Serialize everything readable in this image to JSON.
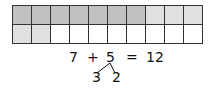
{
  "grid": {
    "rows": 2,
    "cols": 10,
    "colors": {
      "dark": "#c0c0c0",
      "light": "#e0e0e0",
      "empty": "#ffffff",
      "border": "#333333"
    },
    "cells": [
      [
        "dark",
        "dark",
        "dark",
        "dark",
        "dark",
        "dark",
        "dark",
        "light",
        "light",
        "light"
      ],
      [
        "light",
        "light",
        "empty",
        "empty",
        "empty",
        "empty",
        "empty",
        "empty",
        "empty",
        "empty"
      ]
    ]
  },
  "equation": {
    "a": "7",
    "op": "+",
    "b": "5",
    "eq": "=",
    "result": "12"
  },
  "decomposition": {
    "left": "3",
    "right": "2"
  }
}
